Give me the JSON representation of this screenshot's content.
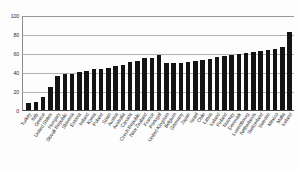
{
  "chart_data": {
    "type": "bar",
    "title": "",
    "subtitle": "",
    "xlabel": "",
    "ylabel": "",
    "ylim": [
      0,
      100
    ],
    "yticks": [
      0,
      20,
      40,
      60,
      80,
      100
    ],
    "grid": true,
    "legend": false,
    "bar_color": "#141414",
    "gridline_color": "#b3b3b3",
    "axis_color": "#4a4a4a",
    "categories": [
      "Turkey",
      "Italy",
      "Greece",
      "United States",
      "Hungary",
      "Slovak Republic",
      "Slovenia",
      "Estonia",
      "Ireland",
      "Korea",
      "Poland",
      "Spain",
      "Austria",
      "Australia",
      "Canada",
      "Czech Republic",
      "New Zealand",
      "France",
      "Portugal",
      "United Kingdom",
      "Belgium",
      "Germany",
      "Japan",
      "Israel",
      "Chile",
      "Latvia",
      "Iceland",
      "Finland",
      "Norway",
      "Denmark",
      "Luxembourg",
      "Netherlands",
      "Switzerland",
      "Sweden",
      "Mexico",
      "Malta",
      "Iceland"
    ],
    "values": [
      7,
      8,
      14,
      24,
      36,
      38,
      38,
      40,
      41,
      43,
      43,
      44,
      46,
      47,
      51,
      52,
      55,
      55,
      58,
      49,
      49,
      50,
      51,
      52,
      53,
      54,
      56,
      57,
      58,
      59,
      60,
      61,
      62,
      63,
      64,
      66,
      82
    ]
  }
}
